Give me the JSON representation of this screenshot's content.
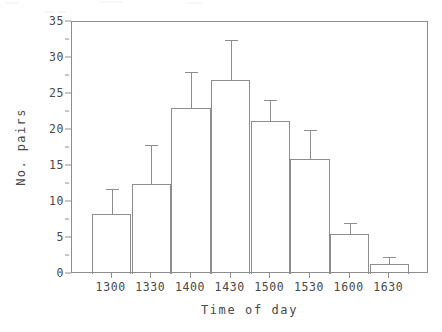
{
  "chart_data": {
    "type": "bar",
    "title": "",
    "subtitle": "",
    "xlabel": "Time of day",
    "ylabel": "No. pairs",
    "categories": [
      "1300",
      "1330",
      "1400",
      "1430",
      "1500",
      "1530",
      "1600",
      "1630"
    ],
    "values": [
      8.3,
      12.5,
      23.0,
      27.0,
      21.2,
      16.0,
      5.6,
      1.4
    ],
    "error_upper": [
      11.8,
      17.9,
      28.0,
      32.5,
      24.2,
      20.0,
      7.1,
      2.3
    ],
    "error_bars": "upper-only",
    "ylim": [
      0,
      35
    ],
    "yticks": [
      0,
      5,
      10,
      15,
      20,
      25,
      30,
      35
    ],
    "ytick_labels": [
      "0",
      "5",
      "10",
      "15",
      "20",
      "25",
      "30",
      "35"
    ],
    "yticks_minor": [
      2.5,
      7.5,
      12.5,
      17.5,
      22.5,
      27.5,
      32.5
    ],
    "xtick_labels": [
      "1300",
      "1330",
      "1400",
      "1430",
      "1500",
      "1530",
      "1600",
      "1630"
    ],
    "grid": false,
    "legend": null,
    "bar_style": "histogram-adjacent-outline",
    "colors": {
      "background": "#ffffff",
      "line": "#8d8d8d",
      "text": "#4a4a4a",
      "bar_fill": "transparent"
    }
  }
}
